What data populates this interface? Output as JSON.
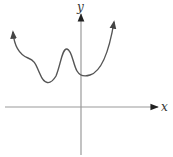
{
  "figure": {
    "type": "function-graph-sketch",
    "x_axis_label": "x",
    "y_axis_label": "y",
    "colors": {
      "axis": "#9a9a9a",
      "arrowhead": "#222222",
      "curve": "#555555",
      "label": "#333333"
    },
    "curve": {
      "description": "Continuous curve with arrows on both ends, rising to the left and right; a local minimum left of the y-axis, a local maximum left of the y-axis, and a local minimum just right of the y-axis, all above the x-axis",
      "both_ends_arrow": true
    }
  }
}
